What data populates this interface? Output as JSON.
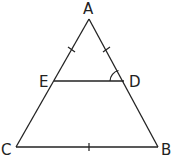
{
  "diagram": {
    "type": "geometry-triangle",
    "points": {
      "A": {
        "label": "A",
        "x": 89,
        "y": 19
      },
      "E": {
        "label": "E",
        "x": 54,
        "y": 81
      },
      "D": {
        "label": "D",
        "x": 124,
        "y": 81
      },
      "C": {
        "label": "C",
        "x": 16,
        "y": 147
      },
      "B": {
        "label": "B",
        "x": 158,
        "y": 147
      }
    },
    "segments": [
      "AC",
      "AB",
      "CB",
      "ED"
    ],
    "tick_marks": [
      "AE",
      "AD",
      "CB"
    ],
    "angle_marks": [
      "ADE"
    ],
    "stroke_color": "#222222"
  }
}
